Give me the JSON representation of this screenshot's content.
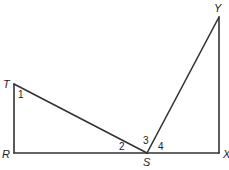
{
  "diagram": {
    "points": {
      "T": {
        "label": "T",
        "x": 14,
        "y": 84
      },
      "R": {
        "label": "R",
        "x": 14,
        "y": 153
      },
      "S": {
        "label": "S",
        "x": 147,
        "y": 153
      },
      "X": {
        "label": "X",
        "x": 219,
        "y": 153
      },
      "Y": {
        "label": "Y",
        "x": 219,
        "y": 17
      }
    },
    "segments": [
      "TR",
      "RS",
      "SX",
      "XY",
      "TS",
      "SY"
    ],
    "angles": [
      {
        "label": "1",
        "vertex": "T"
      },
      {
        "label": "2",
        "vertex": "S",
        "between": "TS-SR"
      },
      {
        "label": "3",
        "vertex": "S",
        "between": "TS-SY"
      },
      {
        "label": "4",
        "vertex": "S",
        "between": "SY-SX"
      }
    ],
    "color": "#333333"
  }
}
